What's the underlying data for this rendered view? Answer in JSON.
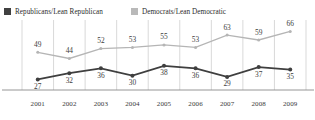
{
  "legend": {
    "items": [
      {
        "label": "Republicans/Lean Republican",
        "color": "#404040",
        "key": "republican"
      },
      {
        "label": "Democrats/Lean Democratic",
        "color": "#b9b9b9",
        "key": "democrat"
      }
    ]
  },
  "colors": {
    "republican_line": "#3f3f3f",
    "democrat_line": "#b5b5b5",
    "gridline": "#c8c8c8",
    "axis": "#8a8a8a",
    "label_text": "#3d3d3d"
  },
  "chart_data": {
    "type": "line",
    "title": "",
    "subtitle": "",
    "xlabel": "",
    "ylabel": "",
    "categories": [
      "2001",
      "2002",
      "2003",
      "2004",
      "2005",
      "2006",
      "2007",
      "2008",
      "2009"
    ],
    "x": [
      2001,
      2002,
      2003,
      2004,
      2005,
      2006,
      2007,
      2008,
      2009
    ],
    "ylim": [
      20,
      72
    ],
    "grid": "vertical",
    "legend_position": "top-left",
    "series": [
      {
        "name": "Republicans/Lean Republican",
        "color": "#3f3f3f",
        "values": [
          27,
          32,
          36,
          30,
          38,
          36,
          29,
          37,
          35
        ],
        "labels": [
          "27",
          "32",
          "36",
          "30",
          "38",
          "36",
          "29",
          "37",
          "35"
        ],
        "label_position": "below"
      },
      {
        "name": "Democrats/Lean Democratic",
        "color": "#b5b5b5",
        "values": [
          49,
          44,
          52,
          53,
          55,
          53,
          63,
          59,
          66
        ],
        "labels": [
          "49",
          "44",
          "52",
          "53",
          "55",
          "53",
          "63",
          "59",
          "66"
        ],
        "label_position": "above"
      }
    ]
  }
}
